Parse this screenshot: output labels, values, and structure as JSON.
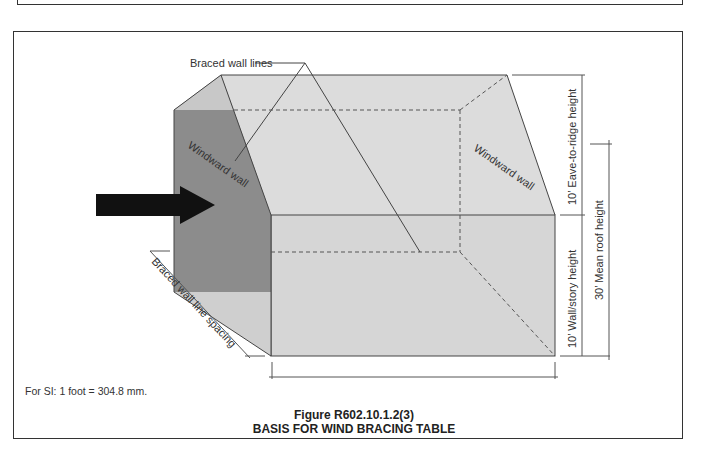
{
  "figure": {
    "number": "Figure R602.10.1.2(3)",
    "title": "BASIS FOR WIND BRACING TABLE"
  },
  "labels": {
    "braced_wall_lines": "Braced wall lines",
    "windward_wall_left": "Windward wall",
    "windward_wall_right": "Windward wall",
    "eave_to_ridge": "10’ Eave-to-ridge height",
    "wall_story_height": "10’ Wall/story height",
    "mean_roof_height": "30’ Mean roof height",
    "braced_wall_line_spacing": "Braced wall line spacing"
  },
  "note": {
    "si_conversion": "For SI:   1 foot = 304.8 mm."
  },
  "icons": {
    "wind_arrow": "wind-direction-arrow"
  },
  "colors": {
    "windward_wall_fill": "#8c8c8c",
    "building_face_fill": "#d6d6d6",
    "roof_fill": "#dcdcdc",
    "end_lower_fill": "#cfcfcf",
    "line": "#444444",
    "arrow": "#111111"
  }
}
